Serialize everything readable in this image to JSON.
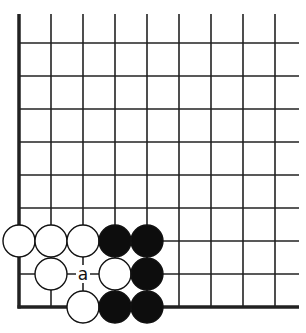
{
  "diagram": {
    "type": "go-board-corner",
    "corner": "bottom-left",
    "columns_visible": 9,
    "rows_visible": 9,
    "colors": {
      "line": "#222222",
      "black_stone": "#0d0d0d",
      "white_stone": "#ffffff",
      "background": "#ffffff"
    },
    "star_point": {
      "col": 3,
      "row": 2
    },
    "stones": [
      {
        "color": "white",
        "col": 0,
        "row": 2
      },
      {
        "color": "white",
        "col": 1,
        "row": 2
      },
      {
        "color": "white",
        "col": 2,
        "row": 2
      },
      {
        "color": "black",
        "col": 3,
        "row": 2
      },
      {
        "color": "black",
        "col": 4,
        "row": 2
      },
      {
        "color": "white",
        "col": 1,
        "row": 1
      },
      {
        "color": "white",
        "col": 3,
        "row": 1
      },
      {
        "color": "black",
        "col": 4,
        "row": 1
      },
      {
        "color": "white",
        "col": 2,
        "row": 0
      },
      {
        "color": "black",
        "col": 3,
        "row": 0
      },
      {
        "color": "black",
        "col": 4,
        "row": 0
      }
    ],
    "labels": [
      {
        "text": "a",
        "col": 2,
        "row": 1
      }
    ]
  }
}
